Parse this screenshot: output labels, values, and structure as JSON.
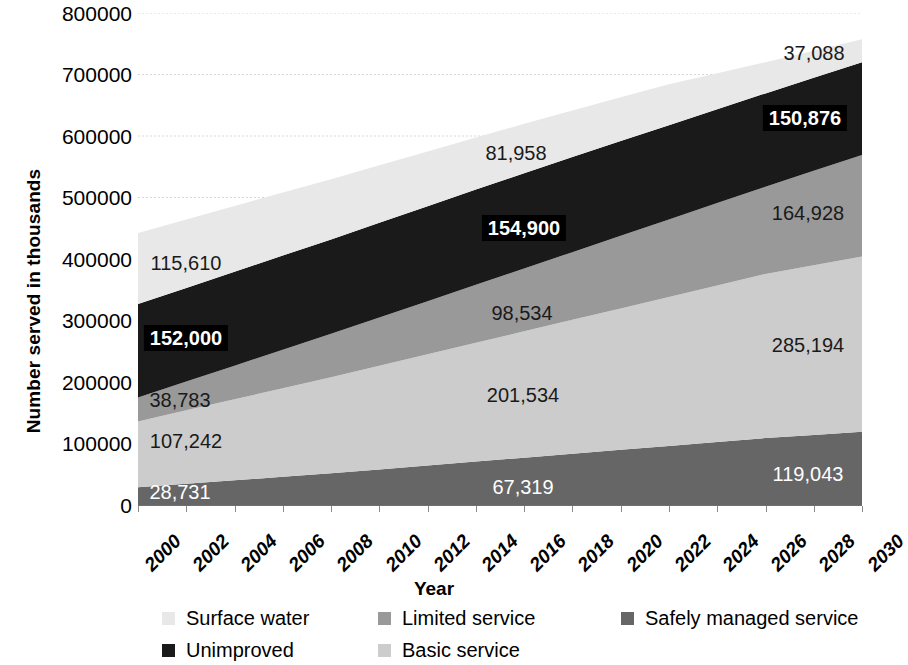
{
  "chart_data": {
    "type": "area",
    "stacked": true,
    "title": "",
    "xlabel": "Year",
    "ylabel": "Number served in thousands",
    "ylim": [
      0,
      800000
    ],
    "ytick_labels": [
      "800000",
      "700000",
      "600000",
      "500000",
      "400000",
      "300000",
      "200000",
      "100000",
      "0"
    ],
    "ytick_values": [
      800000,
      700000,
      600000,
      500000,
      400000,
      300000,
      200000,
      100000,
      0
    ],
    "grid": true,
    "grid_style": "dotted-horizontal",
    "legend_position": "bottom",
    "x": [
      2000,
      2002,
      2004,
      2006,
      2008,
      2010,
      2012,
      2014,
      2016,
      2018,
      2020,
      2022,
      2024,
      2026,
      2028,
      2030
    ],
    "categories": [
      "2000",
      "2002",
      "2004",
      "2006",
      "2008",
      "2010",
      "2012",
      "2014",
      "2016",
      "2018",
      "2020",
      "2022",
      "2024",
      "2026",
      "2028",
      "2030"
    ],
    "series": [
      {
        "name": "Safely managed service",
        "color": "#666666",
        "stack_order": 1,
        "values": [
          28731,
          34430,
          40130,
          45830,
          51530,
          57900,
          64270,
          70640,
          77010,
          83380,
          89750,
          96120,
          102490,
          108860,
          113950,
          119043
        ]
      },
      {
        "name": "Basic service",
        "color": "#cccccc",
        "stack_order": 2,
        "values": [
          107242,
          119500,
          131760,
          144020,
          156280,
          168560,
          180840,
          193120,
          205400,
          217680,
          229960,
          242240,
          254520,
          266800,
          276000,
          285194
        ]
      },
      {
        "name": "Limited service",
        "color": "#999999",
        "stack_order": 3,
        "values": [
          38783,
          46700,
          54620,
          62540,
          70460,
          78390,
          86320,
          94250,
          102180,
          110110,
          118040,
          125970,
          133900,
          141830,
          153380,
          164928
        ]
      },
      {
        "name": "Unimproved",
        "color": "#1a1a1a",
        "stack_order": 4,
        "values": [
          152000,
          152400,
          152800,
          153200,
          153600,
          154000,
          154400,
          154800,
          155000,
          154600,
          154000,
          153200,
          152500,
          151800,
          151300,
          150876
        ]
      },
      {
        "name": "Surface water",
        "color": "#e8e8e8",
        "stack_order": 5,
        "values": [
          115610,
          111200,
          106800,
          102400,
          98000,
          93500,
          89000,
          84600,
          80200,
          75700,
          71300,
          66800,
          58800,
          50700,
          43900,
          37088
        ]
      }
    ],
    "annotations": [
      {
        "text": "115,610",
        "series": "Surface water",
        "year": 2000,
        "style": "dark"
      },
      {
        "text": "152,000",
        "series": "Unimproved",
        "year": 2000,
        "style": "boxed"
      },
      {
        "text": "38,783",
        "series": "Limited service",
        "year": 2000,
        "style": "dark"
      },
      {
        "text": "107,242",
        "series": "Basic service",
        "year": 2000,
        "style": "dark"
      },
      {
        "text": "28,731",
        "series": "Safely managed service",
        "year": 2000,
        "style": "light"
      },
      {
        "text": "81,958",
        "series": "Surface water",
        "year": 2015,
        "style": "dark"
      },
      {
        "text": "154,900",
        "series": "Unimproved",
        "year": 2015,
        "style": "boxed"
      },
      {
        "text": "98,534",
        "series": "Limited service",
        "year": 2015,
        "style": "dark"
      },
      {
        "text": "201,534",
        "series": "Basic service",
        "year": 2015,
        "style": "dark"
      },
      {
        "text": "67,319",
        "series": "Safely managed service",
        "year": 2015,
        "style": "light"
      },
      {
        "text": "37,088",
        "series": "Surface water",
        "year": 2030,
        "style": "dark"
      },
      {
        "text": "150,876",
        "series": "Unimproved",
        "year": 2030,
        "style": "boxed"
      },
      {
        "text": "164,928",
        "series": "Limited service",
        "year": 2030,
        "style": "dark"
      },
      {
        "text": "285,194",
        "series": "Basic service",
        "year": 2030,
        "style": "dark"
      },
      {
        "text": "119,043",
        "series": "Safely managed service",
        "year": 2030,
        "style": "light"
      }
    ]
  },
  "axes": {
    "y_title": "Number served in thousands",
    "x_title": "Year",
    "y_tick_0": "800000",
    "y_tick_1": "700000",
    "y_tick_2": "600000",
    "y_tick_3": "500000",
    "y_tick_4": "400000",
    "y_tick_5": "300000",
    "y_tick_6": "200000",
    "y_tick_7": "100000",
    "y_tick_8": "0"
  },
  "x_labels": {
    "l0": "2000",
    "l1": "2002",
    "l2": "2004",
    "l3": "2006",
    "l4": "2008",
    "l5": "2010",
    "l6": "2012",
    "l7": "2014",
    "l8": "2016",
    "l9": "2018",
    "l10": "2020",
    "l11": "2022",
    "l12": "2024",
    "l13": "2026",
    "l14": "2028",
    "l15": "2030"
  },
  "labels": {
    "sw_2000": "115,610",
    "un_2000": "152,000",
    "ls_2000": "38,783",
    "bs_2000": "107,242",
    "sm_2000": "28,731",
    "sw_2015": "81,958",
    "un_2015": "154,900",
    "ls_2015": "98,534",
    "bs_2015": "201,534",
    "sm_2015": "67,319",
    "sw_2030": "37,088",
    "un_2030": "150,876",
    "ls_2030": "164,928",
    "bs_2030": "285,194",
    "sm_2030": "119,043"
  },
  "legend": {
    "items": [
      {
        "label": "Surface water",
        "color": "#e8e8e8"
      },
      {
        "label": "Limited service",
        "color": "#999999"
      },
      {
        "label": "Safely managed service",
        "color": "#666666"
      },
      {
        "label": "Unimproved",
        "color": "#1a1a1a"
      },
      {
        "label": "Basic service",
        "color": "#cccccc"
      }
    ]
  },
  "colors": {
    "surface_water": "#e8e8e8",
    "limited_service": "#999999",
    "safely_managed": "#666666",
    "unimproved": "#1a1a1a",
    "basic_service": "#cccccc",
    "grid": "#d8d8d8",
    "axis": "#6f6f6f"
  }
}
